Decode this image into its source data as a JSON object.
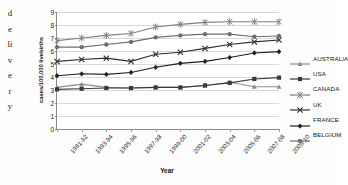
{
  "margin_note": {
    "chars": [
      "d",
      "e",
      "li",
      "v",
      "e",
      "r",
      "y"
    ],
    "full_text": "delivery"
  },
  "chart_data": {
    "type": "line",
    "title": "",
    "xlabel": "Year",
    "ylabel": "cases/100,000 livebirths",
    "ylim": [
      0,
      9
    ],
    "ytick_labels": [
      "0",
      "1",
      "2",
      "3",
      "4",
      "5",
      "6",
      "7",
      "8",
      "9"
    ],
    "grid": "horizontal",
    "legend_position": "right",
    "categories": [
      "1991-92",
      "1993-94",
      "1995-96",
      "1997-98",
      "1999-00",
      "2001-02",
      "2003-04",
      "2005-06",
      "2007-08",
      "2009-10"
    ],
    "series": [
      {
        "name": "AUSTRALIA",
        "marker": "triangle",
        "color": "#8d8d8d",
        "values": [
          3.2,
          3.45,
          3.2,
          3.15,
          3.2,
          3.2,
          3.35,
          3.6,
          3.25,
          3.25
        ]
      },
      {
        "name": "USA",
        "marker": "square",
        "color": "#3a3a3a",
        "values": [
          3.05,
          3.1,
          3.15,
          3.15,
          3.2,
          3.2,
          3.35,
          3.55,
          3.85,
          3.95
        ]
      },
      {
        "name": "CANADA",
        "marker": "star",
        "color": "#7f7f7f",
        "values": [
          6.8,
          7.0,
          7.2,
          7.35,
          7.85,
          8.05,
          8.2,
          8.25,
          8.25,
          8.25
        ]
      },
      {
        "name": "UK",
        "marker": "cross",
        "color": "#2e2e2e",
        "values": [
          5.2,
          5.35,
          5.45,
          5.2,
          5.75,
          5.9,
          6.2,
          6.5,
          6.7,
          6.85
        ]
      },
      {
        "name": "FRANCE",
        "marker": "diamond",
        "color": "#1f1f1f",
        "values": [
          4.1,
          4.25,
          4.2,
          4.35,
          4.75,
          5.05,
          5.2,
          5.5,
          5.85,
          5.95
        ]
      },
      {
        "name": "BELGIUM",
        "marker": "circle",
        "color": "#6e6e6e",
        "values": [
          6.3,
          6.3,
          6.5,
          6.7,
          7.05,
          7.2,
          7.3,
          7.3,
          7.1,
          7.15
        ]
      }
    ]
  }
}
